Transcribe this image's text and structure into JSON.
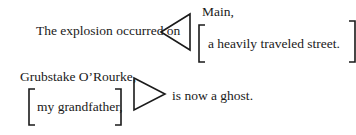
{
  "diagram": {
    "example1": {
      "lead_text": "The explosion occurred on",
      "pointer_direction": "left",
      "appositive_main": "Main,",
      "appositive_bracketed": "a heavily traveled street."
    },
    "example2": {
      "subject": "Grubstake O’Rourke,",
      "appositive_bracketed": "my grandfather,",
      "pointer_direction": "right",
      "predicate": "is now a ghost."
    },
    "colors": {
      "ink": "#1a1a1a",
      "background": "#ffffff"
    }
  }
}
